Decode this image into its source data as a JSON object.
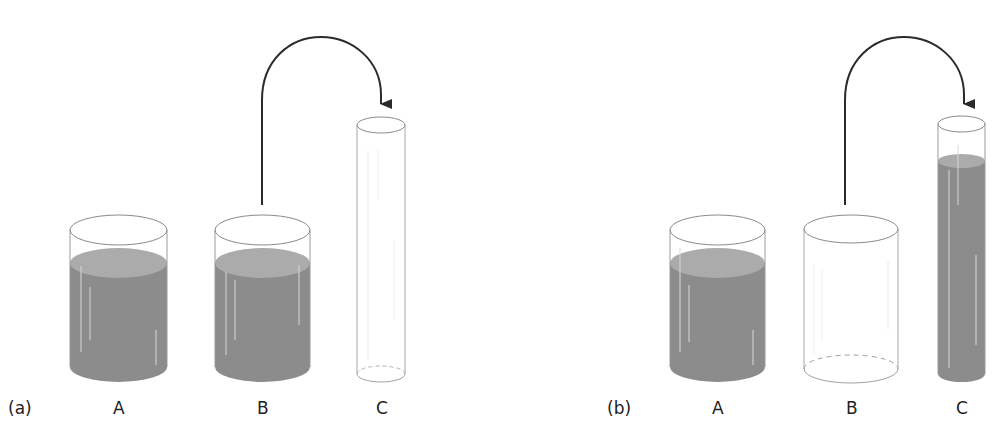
{
  "panels": [
    {
      "id": "a",
      "label": "(a)",
      "containers": [
        {
          "name": "A",
          "label": "A",
          "state": "filled"
        },
        {
          "name": "B",
          "label": "B",
          "state": "filled"
        },
        {
          "name": "C",
          "label": "C",
          "state": "empty"
        }
      ],
      "arrow": {
        "from": "B",
        "to": "C"
      }
    },
    {
      "id": "b",
      "label": "(b)",
      "containers": [
        {
          "name": "A",
          "label": "A",
          "state": "filled"
        },
        {
          "name": "B",
          "label": "B",
          "state": "empty"
        },
        {
          "name": "C",
          "label": "C",
          "state": "filled"
        }
      ],
      "arrow": {
        "from": "B",
        "to": "C"
      }
    }
  ],
  "colors": {
    "liquid": "#8c8c8c",
    "liquid_surface": "#ababab",
    "outline": "#9a9a9a",
    "arrow": "#2a2a2a"
  }
}
